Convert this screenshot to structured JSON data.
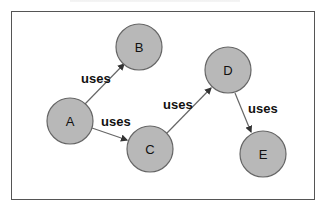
{
  "diagram": {
    "type": "directed-graph",
    "node_fill": "#b8b8b8",
    "node_stroke": "#666666",
    "edge_color": "#555555",
    "nodes": [
      {
        "id": "A",
        "label": "A",
        "cx": 70,
        "cy": 121
      },
      {
        "id": "B",
        "label": "B",
        "cx": 139,
        "cy": 47
      },
      {
        "id": "C",
        "label": "C",
        "cx": 150,
        "cy": 149
      },
      {
        "id": "D",
        "label": "D",
        "cx": 228,
        "cy": 70
      },
      {
        "id": "E",
        "label": "E",
        "cx": 263,
        "cy": 154
      }
    ],
    "edges": [
      {
        "from": "A",
        "to": "B",
        "label": "uses"
      },
      {
        "from": "A",
        "to": "C",
        "label": "uses"
      },
      {
        "from": "C",
        "to": "D",
        "label": "uses"
      },
      {
        "from": "D",
        "to": "E",
        "label": "uses"
      }
    ]
  }
}
